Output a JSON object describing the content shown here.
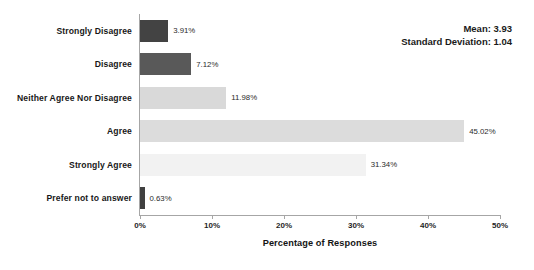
{
  "chart_data": {
    "type": "bar",
    "orientation": "horizontal",
    "title": "",
    "xlabel": "Percentage of Responses",
    "ylabel": "",
    "xlim": [
      0,
      50
    ],
    "grid": false,
    "legend": null,
    "categories": [
      "Strongly Disagree",
      "Disagree",
      "Neither Agree Nor Disagree",
      "Agree",
      "Strongly Agree",
      "Prefer not to answer"
    ],
    "values": [
      3.91,
      7.12,
      11.98,
      45.02,
      31.34,
      0.63
    ],
    "value_labels": [
      "3.91%",
      "7.12%",
      "11.98%",
      "45.02%",
      "31.34%",
      "0.63%"
    ],
    "bar_colors": [
      "#434343",
      "#595959",
      "#d9d9d9",
      "#dcdcdc",
      "#f2f2f2",
      "#404040"
    ],
    "xticks": [
      0,
      10,
      20,
      30,
      40,
      50
    ],
    "xtick_labels": [
      "0%",
      "10%",
      "20%",
      "30%",
      "40%",
      "50%"
    ],
    "annotations": [
      {
        "label": "Mean: 3.93"
      },
      {
        "label": "Standard Deviation: 1.04"
      }
    ]
  },
  "axis": {
    "line_color": "#a6a6a6"
  }
}
